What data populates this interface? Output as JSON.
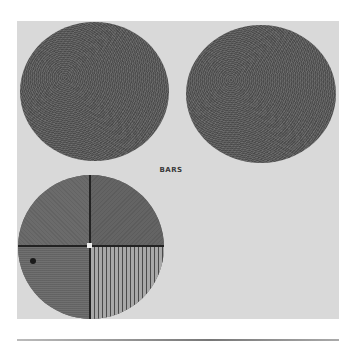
{
  "figure": {
    "label": "BARS",
    "panel_color": "#d9d9d9",
    "discs": [
      {
        "name": "uniform-noise-disc-left",
        "texture": "noise"
      },
      {
        "name": "uniform-noise-disc-right",
        "texture": "noise"
      },
      {
        "name": "quadrant-disc",
        "texture": "quadrants",
        "quadrants": [
          "noise",
          "noise",
          "horizontal-fine",
          "vertical-bars"
        ]
      }
    ]
  }
}
